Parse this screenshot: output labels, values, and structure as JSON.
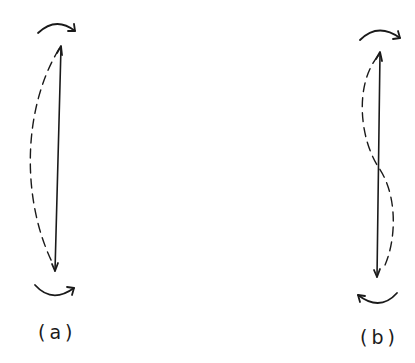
{
  "figure": {
    "panels": [
      {
        "id": "a",
        "label": "(a)",
        "description": "Beam bent in single curvature: equal end moments rotating in the same sense produce a one-sided (C-shaped) deflected shape",
        "top_moment": "clockwise",
        "bottom_moment": "counterclockwise",
        "deflected_shape": "single-curvature"
      },
      {
        "id": "b",
        "label": "(b)",
        "description": "Beam bent in double (reverse) curvature: end moments produce an S-shaped deflected shape crossing the member axis at mid-height",
        "top_moment": "clockwise",
        "bottom_moment": "clockwise",
        "deflected_shape": "double-curvature"
      }
    ]
  },
  "colors": {
    "ink": "#1a1a1a",
    "background": "#ffffff"
  }
}
